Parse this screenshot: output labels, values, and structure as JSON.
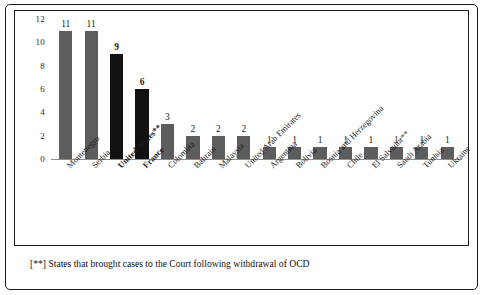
{
  "chart_data": {
    "type": "bar",
    "title": "",
    "xlabel": "",
    "ylabel": "",
    "ylim": [
      0,
      12
    ],
    "yticks": [
      0,
      2,
      4,
      6,
      8,
      10,
      12
    ],
    "grid": false,
    "legend": null,
    "categories": [
      "Montenegro",
      "Serbia",
      "United States**",
      "France",
      "Colombia",
      "Bahrain",
      "Malaysia",
      "United Arab Emirates",
      "Argentina",
      "Bolivia",
      "Bosnia and Herzegovina",
      "Chile",
      "El Salvador**",
      "Saudi Arabia",
      "Tunisia",
      "Ukraine"
    ],
    "values": [
      11,
      11,
      9,
      6,
      3,
      2,
      2,
      2,
      1,
      1,
      1,
      1,
      1,
      1,
      1,
      1
    ],
    "bar_colors": [
      "#5d5d5d",
      "#5d5d5d",
      "#111111",
      "#111111",
      "#5d5d5d",
      "#5d5d5d",
      "#5d5d5d",
      "#5d5d5d",
      "#5d5d5d",
      "#5d5d5d",
      "#5d5d5d",
      "#5d5d5d",
      "#5d5d5d",
      "#5d5d5d",
      "#5d5d5d",
      "#5d5d5d"
    ],
    "emphasized": [
      false,
      false,
      true,
      true,
      false,
      false,
      false,
      false,
      false,
      false,
      false,
      false,
      false,
      false,
      false,
      false
    ],
    "value_labels": [
      "11",
      "11",
      "9",
      "6",
      "3",
      "2",
      "2",
      "2",
      "1",
      "1",
      "1",
      "1",
      "1",
      "1",
      "1",
      "1"
    ],
    "ytick_labels": [
      "0",
      "2",
      "4",
      "6",
      "8",
      "10",
      "12"
    ]
  },
  "footnote": {
    "text": "[**] States that brought cases to the Court following withdrawal of OCD"
  },
  "colors": {
    "bar_gray": "#5d5d5d",
    "bar_black": "#111111",
    "frame": "#1a1a1a",
    "axis": "#8f8f8f"
  }
}
